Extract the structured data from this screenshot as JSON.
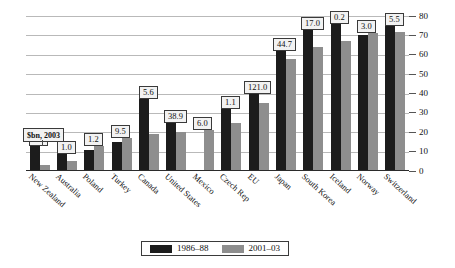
{
  "chart_data": {
    "type": "bar",
    "title": "",
    "subtitle": "",
    "xlabel": "",
    "ylabel": "",
    "ylim": [
      0,
      80
    ],
    "ytick_step": 10,
    "yticks": [
      "80",
      "70",
      "60",
      "50",
      "40",
      "30",
      "20",
      "10",
      "0"
    ],
    "grid": true,
    "legend_position": "bottom",
    "categories": [
      "New Zealand",
      "Australia",
      "Poland",
      "Turkey",
      "Canada",
      "United States",
      "Mexico",
      "Czech Rep",
      "EU",
      "Japan",
      "South Korea",
      "Iceland",
      "Norway",
      "Switzerland"
    ],
    "series": [
      {
        "name": "1986-88",
        "color": "#1c1c1c",
        "values": [
          13,
          9,
          11,
          15,
          37,
          25,
          null,
          32,
          40,
          62,
          73,
          76,
          70,
          75
        ]
      },
      {
        "name": "2001-03",
        "color": "#8e8e8e",
        "values": [
          3,
          5,
          13,
          17,
          19,
          20,
          21,
          25,
          35,
          58,
          64,
          67,
          71,
          72
        ]
      }
    ],
    "data_labels": [
      "0.2",
      "1.0",
      "1.2",
      "9.5",
      "5.6",
      "38.9",
      "6.0",
      "1.1",
      "121.0",
      "44.7",
      "17.0",
      "0.2",
      "3.0",
      "5.5"
    ],
    "annotation": "$bn, 2003"
  },
  "legend": {
    "items": [
      {
        "label": "1986–88",
        "swatch": "s0"
      },
      {
        "label": "2001–03",
        "swatch": "s1"
      }
    ]
  }
}
